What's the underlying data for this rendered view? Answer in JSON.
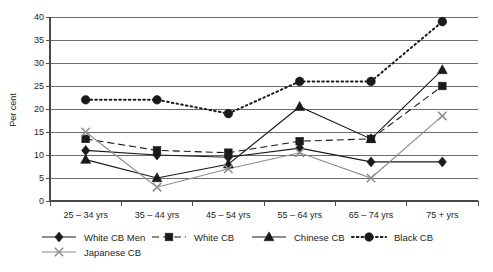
{
  "chart_data": {
    "type": "line",
    "title": "",
    "subtitle": "",
    "xlabel": "",
    "ylabel": "Per cent",
    "categories": [
      "25 – 34 yrs",
      "35 – 44 yrs",
      "45 – 54 yrs",
      "55 – 64 yrs",
      "65 – 74 yrs",
      "75 + yrs"
    ],
    "ylim": [
      0,
      40
    ],
    "ytick_step": 5,
    "yticks": [
      "0",
      "5",
      "10",
      "15",
      "20",
      "25",
      "30",
      "35",
      "40"
    ],
    "grid": "horizontal",
    "legend_position": "bottom",
    "series": [
      {
        "name": "White CB Men",
        "marker": "diamond",
        "linestyle": "solid",
        "color": "#1a1a1a",
        "values": [
          11,
          10,
          9.5,
          11.5,
          8.5,
          8.5
        ]
      },
      {
        "name": "White CB",
        "marker": "square",
        "linestyle": "dashed",
        "color": "#1a1a1a",
        "values": [
          13.5,
          11,
          10.5,
          13,
          13.5,
          25
        ]
      },
      {
        "name": "Chinese CB",
        "marker": "triangle",
        "linestyle": "solid",
        "color": "#1a1a1a",
        "values": [
          9,
          5,
          8,
          20.5,
          13.5,
          28.5
        ]
      },
      {
        "name": "Black CB",
        "marker": "circle",
        "linestyle": "dotted",
        "color": "#1a1a1a",
        "values": [
          22,
          22,
          19,
          26,
          26,
          39
        ]
      },
      {
        "name": "Japanese CB",
        "marker": "cross",
        "linestyle": "solid",
        "color": "#8c8c8c",
        "values": [
          15,
          3,
          7,
          10.5,
          5,
          18.5
        ]
      }
    ]
  },
  "axis": {
    "y_title": "Per cent"
  },
  "legend": {
    "items": [
      {
        "label": "White CB Men",
        "marker": "diamond",
        "linestyle": "solid",
        "color": "#1a1a1a"
      },
      {
        "label": "White CB",
        "marker": "square",
        "linestyle": "dashed",
        "color": "#1a1a1a"
      },
      {
        "label": "Chinese CB",
        "marker": "triangle",
        "linestyle": "solid",
        "color": "#1a1a1a"
      },
      {
        "label": "Black CB",
        "marker": "circle",
        "linestyle": "dotted",
        "color": "#1a1a1a"
      },
      {
        "label": "Japanese CB",
        "marker": "cross",
        "linestyle": "solid",
        "color": "#8c8c8c"
      }
    ]
  }
}
